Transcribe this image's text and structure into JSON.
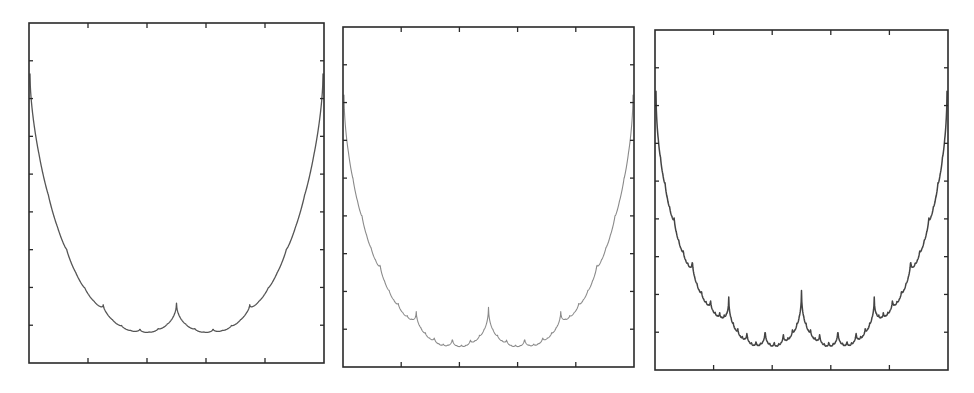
{
  "figure": {
    "panel_count": 3,
    "background": "#ffffff",
    "axis_color": "#2a2a2a"
  },
  "chart_data": [
    {
      "type": "line",
      "title": "",
      "xlabel": "",
      "ylabel": "",
      "description": "Symmetric scalloped fractal curve (self-similar cusps), U-shaped, central cusp; smoothest of the three",
      "xlim": [
        0,
        1
      ],
      "ylim": [
        0,
        1
      ],
      "grid": false,
      "legend": null,
      "x_ticks_count": 4,
      "y_ticks_count": 8,
      "x_tick_labels": [],
      "y_tick_labels": [],
      "curve": {
        "levels": 6,
        "decay": 0.5,
        "roughness": 0.15,
        "color": "#555555",
        "stroke_width": 1.3,
        "top_y_frac": 0.15,
        "bottom_y_frac": 0.91
      },
      "key_points": {
        "cusp_x": [
          0.0625,
          0.125,
          0.25,
          0.5,
          0.75,
          0.875,
          0.9375
        ],
        "minima_y_frac_from_top": 0.9,
        "center_cusp_y_frac_from_top": 0.79
      },
      "frame": {
        "x": 29,
        "y": 23,
        "w": 295,
        "h": 340
      }
    },
    {
      "type": "line",
      "title": "",
      "xlabel": "",
      "ylabel": "",
      "description": "Symmetric scalloped fractal curve, more pronounced secondary cusps; lightest stroke",
      "xlim": [
        0,
        1
      ],
      "ylim": [
        0,
        1
      ],
      "grid": false,
      "legend": null,
      "x_ticks_count": 4,
      "y_ticks_count": 8,
      "x_tick_labels": [],
      "y_tick_labels": [],
      "curve": {
        "levels": 7,
        "decay": 0.55,
        "roughness": 0.35,
        "color": "#8a8a8a",
        "stroke_width": 1.1,
        "top_y_frac": 0.2,
        "bottom_y_frac": 0.94
      },
      "key_points": {
        "cusp_x": [
          0.0625,
          0.125,
          0.25,
          0.375,
          0.5,
          0.625,
          0.75,
          0.875,
          0.9375
        ],
        "minima_y_frac_from_top": 0.94,
        "center_cusp_y_frac_from_top": 0.8
      },
      "frame": {
        "x": 343,
        "y": 27,
        "w": 291,
        "h": 340
      }
    },
    {
      "type": "line",
      "title": "",
      "xlabel": "",
      "ylabel": "",
      "description": "Symmetric scalloped fractal curve, roughest with dense sub-cusps and darker texture",
      "xlim": [
        0,
        1
      ],
      "ylim": [
        0,
        1
      ],
      "grid": false,
      "legend": null,
      "x_ticks_count": 4,
      "y_ticks_count": 8,
      "x_tick_labels": [],
      "y_tick_labels": [],
      "curve": {
        "levels": 8,
        "decay": 0.6,
        "roughness": 0.6,
        "color": "#444444",
        "stroke_width": 1.5,
        "top_y_frac": 0.18,
        "bottom_y_frac": 0.93
      },
      "key_points": {
        "cusp_x": [
          0.03125,
          0.0625,
          0.125,
          0.25,
          0.375,
          0.5,
          0.625,
          0.75,
          0.875,
          0.9375,
          0.96875
        ],
        "minima_y_frac_from_top": 0.93,
        "center_cusp_y_frac_from_top": 0.73
      },
      "frame": {
        "x": 655,
        "y": 30,
        "w": 293,
        "h": 340
      }
    }
  ]
}
